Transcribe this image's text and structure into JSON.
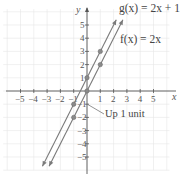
{
  "chart_data": {
    "type": "line",
    "title": "",
    "xlabel": "x",
    "ylabel": "y",
    "xlim": [
      -5.5,
      6
    ],
    "ylim": [
      -6,
      6
    ],
    "grid": true,
    "x_ticks": [
      -5,
      -4,
      -3,
      -2,
      -1,
      1,
      2,
      3,
      4,
      5
    ],
    "y_ticks": [
      -5,
      -4,
      -3,
      -2,
      -1,
      1,
      2,
      3,
      4,
      5
    ],
    "series": [
      {
        "name": "g(x) = 2x + 1",
        "equation": "g(x) = 2x + 1",
        "slope": 2,
        "intercept": 1,
        "points": [
          [
            -1,
            -1
          ],
          [
            0,
            1
          ],
          [
            1,
            3
          ]
        ]
      },
      {
        "name": "f(x) = 2x",
        "equation": "f(x) = 2x",
        "slope": 2,
        "intercept": 0,
        "points": [
          [
            -1,
            -2
          ],
          [
            0,
            0
          ],
          [
            1,
            2
          ]
        ]
      }
    ],
    "annotations": [
      {
        "text": "Up 1 unit",
        "points_to": [
          -1,
          -1.5
        ]
      }
    ],
    "colors": {
      "line": "#7a7a7a",
      "point": "#8a8a8a",
      "axis": "#555555",
      "grid": "#e6e6e6"
    }
  },
  "labels": {
    "x_axis": "x",
    "y_axis": "y",
    "g_label": "g(x) = 2x + 1",
    "f_label": "f(x) = 2x",
    "annotation": "Up 1 unit"
  }
}
